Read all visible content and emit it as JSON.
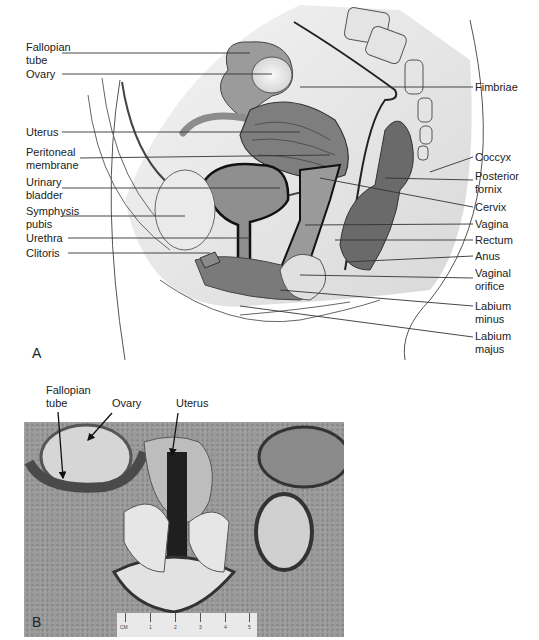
{
  "figure": {
    "panel_a": {
      "letter": "A",
      "left_labels": [
        {
          "id": "fallopian-tube",
          "text": "Fallopian\ntube"
        },
        {
          "id": "ovary",
          "text": "Ovary"
        },
        {
          "id": "uterus",
          "text": "Uterus"
        },
        {
          "id": "peritoneal-membrane",
          "text": "Peritoneal\nmembrane"
        },
        {
          "id": "urinary-bladder",
          "text": "Urinary\nbladder"
        },
        {
          "id": "symphysis-pubis",
          "text": "Symphysis\npubis"
        },
        {
          "id": "urethra",
          "text": "Urethra"
        },
        {
          "id": "clitoris",
          "text": "Clitoris"
        }
      ],
      "right_labels": [
        {
          "id": "fimbriae",
          "text": "Fimbriae"
        },
        {
          "id": "coccyx",
          "text": "Coccyx"
        },
        {
          "id": "posterior-fornix",
          "text": "Posterior\nfornix"
        },
        {
          "id": "cervix",
          "text": "Cervix"
        },
        {
          "id": "vagina",
          "text": "Vagina"
        },
        {
          "id": "rectum",
          "text": "Rectum"
        },
        {
          "id": "anus",
          "text": "Anus"
        },
        {
          "id": "vaginal-orifice",
          "text": "Vaginal\norifice"
        },
        {
          "id": "labium-minus",
          "text": "Labium\nminus"
        },
        {
          "id": "labium-majus",
          "text": "Labium\nmajus"
        }
      ]
    },
    "panel_b": {
      "letter": "B",
      "labels": [
        {
          "id": "fallopian-tube",
          "text": "Fallopian\ntube"
        },
        {
          "id": "ovary",
          "text": "Ovary"
        },
        {
          "id": "uterus",
          "text": "Uterus"
        }
      ],
      "ruler": {
        "unit": "CM",
        "ticks": [
          "1",
          "2",
          "3",
          "4",
          "5"
        ]
      }
    }
  }
}
